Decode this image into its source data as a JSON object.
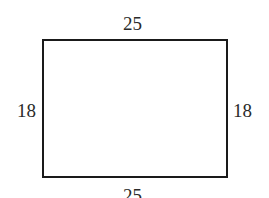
{
  "diagram": {
    "shape": "rectangle",
    "stroke_color": "#1a1a1a",
    "labels": {
      "top": "25",
      "bottom": "25",
      "left": "18",
      "right": "18"
    }
  }
}
